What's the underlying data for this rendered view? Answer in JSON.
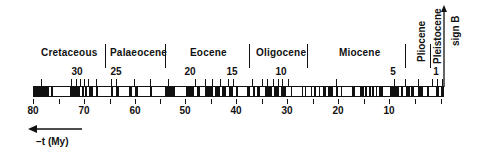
{
  "epochs": [
    {
      "name": "Cretaceous",
      "x": 41
    },
    {
      "name": "Palaeocene",
      "x": 110
    },
    {
      "name": "Eocene",
      "x": 190
    },
    {
      "name": "Oligocene",
      "x": 256
    },
    {
      "name": "Miocene",
      "x": 339
    }
  ],
  "vertical_epochs": [
    {
      "name": "Pliocene",
      "x": 416,
      "y": 62
    },
    {
      "name": "Pleistocene",
      "x": 432,
      "y": 64
    }
  ],
  "separators": [
    105,
    165,
    249,
    307,
    405,
    430
  ],
  "pleistocene_overline": {
    "x": 428,
    "y": 62,
    "width": 6
  },
  "chron_numbers": [
    {
      "label": "30",
      "x": 77
    },
    {
      "label": "25",
      "x": 116
    },
    {
      "label": "20",
      "x": 190
    },
    {
      "label": "15",
      "x": 232
    },
    {
      "label": "10",
      "x": 281
    },
    {
      "label": "5",
      "x": 393
    },
    {
      "label": "1",
      "x": 436
    }
  ],
  "sign_label": "sign B",
  "axis": {
    "x_start_px": 33,
    "x_end_px": 444,
    "t_start": 80,
    "t_end": 0,
    "labels": [
      {
        "value": "80",
        "x": 33
      },
      {
        "value": "70",
        "x": 84
      },
      {
        "value": "60",
        "x": 135
      },
      {
        "value": "50",
        "x": 185
      },
      {
        "value": "40",
        "x": 236
      },
      {
        "value": "30",
        "x": 287
      },
      {
        "value": "20",
        "x": 338
      },
      {
        "value": "10",
        "x": 389
      }
    ],
    "minor_ticks": [
      33,
      59,
      84,
      110,
      135,
      160,
      185,
      211,
      236,
      262,
      287,
      313,
      338,
      364,
      389,
      415,
      441
    ],
    "time_label": "−t (My)"
  },
  "top_ticks": [
    41,
    71,
    76,
    80,
    84,
    88,
    96,
    111,
    116,
    134,
    150,
    168,
    195,
    205,
    212,
    220,
    228,
    233,
    252,
    262,
    267,
    273,
    278,
    282,
    288,
    336,
    394,
    405,
    418,
    432,
    437,
    442
  ],
  "normal_polarity_blocks": [
    [
      33,
      48
    ],
    [
      50,
      51.5
    ],
    [
      69,
      79
    ],
    [
      81,
      82.5
    ],
    [
      84,
      86
    ],
    [
      88,
      92
    ],
    [
      95,
      97
    ],
    [
      110,
      112
    ],
    [
      115,
      118
    ],
    [
      128,
      131
    ],
    [
      134,
      137
    ],
    [
      149,
      151
    ],
    [
      164,
      174
    ],
    [
      185,
      193
    ],
    [
      196,
      199
    ],
    [
      204,
      212
    ],
    [
      214,
      219
    ],
    [
      221,
      225
    ],
    [
      228,
      232
    ],
    [
      235,
      237
    ],
    [
      246,
      249
    ],
    [
      252,
      254
    ],
    [
      256,
      259
    ],
    [
      264,
      271
    ],
    [
      273,
      278
    ],
    [
      280,
      285
    ],
    [
      290,
      291
    ],
    [
      301,
      302
    ],
    [
      304,
      305
    ],
    [
      310,
      311
    ],
    [
      313,
      315
    ],
    [
      318,
      319
    ],
    [
      322,
      325
    ],
    [
      327,
      332
    ],
    [
      335,
      337
    ],
    [
      340,
      341
    ],
    [
      351,
      354
    ],
    [
      359,
      363
    ],
    [
      364,
      366
    ],
    [
      368,
      370
    ],
    [
      371,
      373
    ],
    [
      375,
      376
    ],
    [
      378,
      382
    ],
    [
      389,
      398
    ],
    [
      400,
      402
    ],
    [
      405,
      409
    ],
    [
      410,
      413
    ],
    [
      417,
      422
    ],
    [
      426,
      428
    ],
    [
      435,
      438
    ],
    [
      440,
      444
    ]
  ]
}
